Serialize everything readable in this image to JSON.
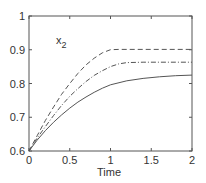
{
  "chart_data": {
    "type": "line",
    "title": "",
    "xlabel": "Time",
    "ylabel": "",
    "xlim": [
      0,
      2
    ],
    "ylim": [
      0.6,
      1.0
    ],
    "xticks": [
      0,
      0.5,
      1,
      1.5,
      2
    ],
    "xtick_labels": [
      "0",
      "0.5",
      "1",
      "1.5",
      "2"
    ],
    "yticks": [
      0.6,
      0.7,
      0.8,
      0.9,
      1.0
    ],
    "ytick_labels": [
      "0.6",
      "0.7",
      "0.8",
      "0.9",
      "1"
    ],
    "grid": false,
    "legend": null,
    "annotations": [
      {
        "text": "x",
        "subscript": "2",
        "x": 0.25,
        "y": 0.93
      }
    ],
    "series": [
      {
        "name": "dashed",
        "style": "dashed",
        "x": [
          0,
          0.1,
          0.2,
          0.3,
          0.4,
          0.5,
          0.6,
          0.7,
          0.8,
          0.9,
          1.0,
          1.1,
          1.2,
          1.4,
          1.6,
          1.8,
          2.0
        ],
        "values": [
          0.6,
          0.645,
          0.69,
          0.73,
          0.768,
          0.8,
          0.83,
          0.855,
          0.875,
          0.891,
          0.9,
          0.901,
          0.901,
          0.901,
          0.901,
          0.901,
          0.901
        ]
      },
      {
        "name": "dash-dot",
        "style": "dashdot",
        "x": [
          0,
          0.1,
          0.2,
          0.3,
          0.4,
          0.5,
          0.6,
          0.7,
          0.8,
          0.9,
          1.0,
          1.1,
          1.2,
          1.4,
          1.6,
          1.8,
          2.0
        ],
        "values": [
          0.6,
          0.638,
          0.672,
          0.705,
          0.735,
          0.762,
          0.785,
          0.806,
          0.824,
          0.838,
          0.85,
          0.858,
          0.862,
          0.863,
          0.863,
          0.863,
          0.863
        ]
      },
      {
        "name": "solid",
        "style": "solid",
        "x": [
          0,
          0.1,
          0.2,
          0.3,
          0.4,
          0.5,
          0.6,
          0.7,
          0.8,
          0.9,
          1.0,
          1.2,
          1.4,
          1.6,
          1.8,
          2.0
        ],
        "values": [
          0.6,
          0.632,
          0.66,
          0.685,
          0.707,
          0.727,
          0.745,
          0.76,
          0.774,
          0.786,
          0.796,
          0.808,
          0.815,
          0.82,
          0.823,
          0.825
        ]
      }
    ]
  },
  "plot": {
    "annotation_main": "x",
    "annotation_sub": "2",
    "xlabel": "Time"
  }
}
